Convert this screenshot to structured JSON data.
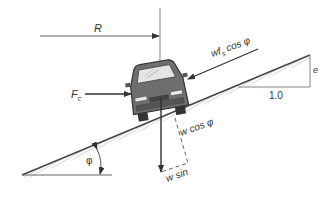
{
  "diagram": {
    "type": "free-body diagram of car on banked curve",
    "labels": {
      "radius": "R",
      "centripetal_force": "F",
      "centripetal_force_sub": "c",
      "friction_prefix": "wf",
      "friction_sub": "s",
      "friction_suffix": " cos φ",
      "weight_normal": "w cos φ",
      "weight": "w sin",
      "slope_rise": "e",
      "slope_run": "1.0",
      "bank_angle": "φ"
    },
    "colors": {
      "line": "#444444",
      "car_body": "#6e6e6e",
      "hatch": "#aaaaaa",
      "text": "#333333"
    }
  }
}
